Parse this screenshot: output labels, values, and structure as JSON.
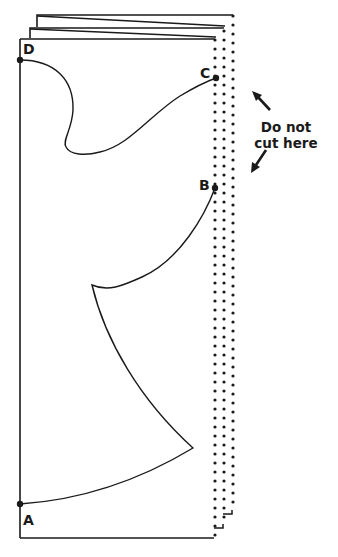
{
  "diagram": {
    "colors": {
      "ink": "#1a1a1a",
      "background": "#ffffff"
    },
    "points": [
      {
        "id": "D",
        "label": "D",
        "x": 20,
        "y": 60
      },
      {
        "id": "C",
        "label": "C",
        "x": 216,
        "y": 78
      },
      {
        "id": "B",
        "label": "B",
        "x": 215,
        "y": 188
      },
      {
        "id": "A",
        "label": "A",
        "x": 20,
        "y": 504
      }
    ],
    "annotation": {
      "line1": "Do not",
      "line2": "cut here",
      "arrows": [
        "arrow-up-left",
        "arrow-down-left"
      ]
    },
    "layers": [
      {
        "name": "back-sheet",
        "dotted_edge_x": 233
      },
      {
        "name": "middle-sheet",
        "dotted_edge_x": 224
      },
      {
        "name": "front-sheet",
        "dotted_edge_x": 215
      }
    ]
  }
}
